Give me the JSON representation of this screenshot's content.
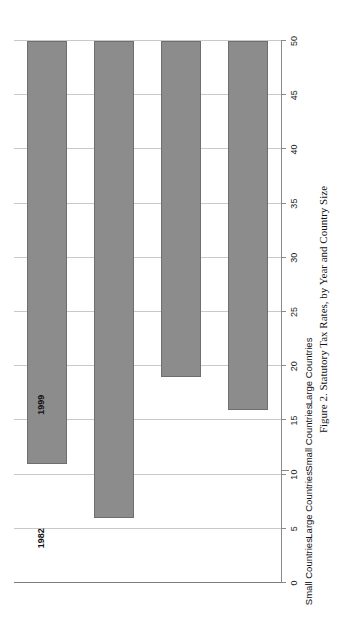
{
  "figure": {
    "caption": "Figure 2. Statutory Tax Rates, by Year and Country Size"
  },
  "chart_data": {
    "type": "bar",
    "title": "Figure 2. Statutory Tax Rates, by Year and Country Size",
    "orientation": "vertical",
    "xlabel": "",
    "ylabel": "",
    "ylim": [
      0,
      50
    ],
    "yticks": [
      0,
      5,
      10,
      15,
      20,
      25,
      30,
      35,
      40,
      45,
      50
    ],
    "ytick_labels": [
      "0",
      "5",
      "10",
      "15",
      "20",
      "25",
      "30",
      "35",
      "40",
      "45",
      "50"
    ],
    "grid": true,
    "legend": "none",
    "groups": [
      "1982",
      "1999"
    ],
    "categories": [
      "Small Countries",
      "Large Countries",
      "Small Countries",
      "Large Countries"
    ],
    "values": [
      39,
      44,
      31,
      34
    ],
    "bars": [
      {
        "group": "1982",
        "category": "Small Countries",
        "value": 39
      },
      {
        "group": "1982",
        "category": "Large Countries",
        "value": 44
      },
      {
        "group": "1999",
        "category": "Small Countries",
        "value": 31
      },
      {
        "group": "1999",
        "category": "Large Countries",
        "value": 34
      }
    ],
    "bar_color": "#8c8c8c",
    "bar_edge_color": "#6f6f6f",
    "grid_color": "#c9c9c9",
    "axis_color": "#8a8a8a"
  }
}
